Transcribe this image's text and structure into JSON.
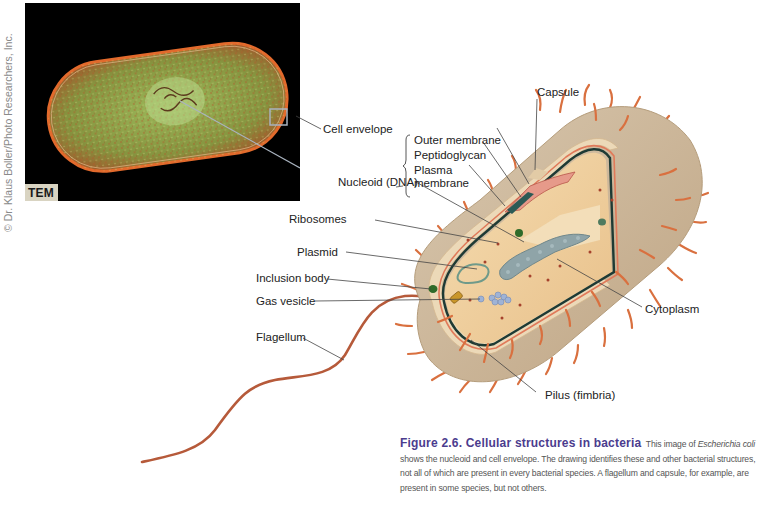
{
  "credit": "© Dr. Klaus Boller/Photo Researchers, Inc.",
  "micrograph": {
    "badge": "TEM"
  },
  "labels": {
    "capsule": "Capsule",
    "cell_envelope": "Cell envelope",
    "outer_membrane": "Outer membrane",
    "peptidoglycan": "Peptidoglycan",
    "plasma_membrane_1": "Plasma",
    "plasma_membrane_2": "membrane",
    "nucleoid": "Nucleoid (DNA)",
    "ribosomes": "Ribosomes",
    "plasmid": "Plasmid",
    "inclusion_body": "Inclusion body",
    "gas_vesicle": "Gas vesicle",
    "flagellum": "Flagellum",
    "cytoplasm": "Cytoplasm",
    "pilus": "Pilus (fimbria)"
  },
  "caption": {
    "title": "Figure 2.6.  Cellular structures in bacteria",
    "text_1": "This image of ",
    "species": "Escherichia coli",
    "text_2": " shows the nucleoid and cell envelope. The drawing identifies these and other bacterial structures, not all of which are present in every bacterial species. A flagellum and capsule, for example, are present in some species, but not others."
  },
  "colors": {
    "title_purple": "#4b3c8e",
    "capsule_tan": "#c9b49a",
    "cytoplasm": "#f0d3a2",
    "membrane_dark": "#1e3a34",
    "pili_orange": "#d9703f",
    "flagellum": "#b65a3a",
    "micrograph_green": "#7fa04a"
  }
}
